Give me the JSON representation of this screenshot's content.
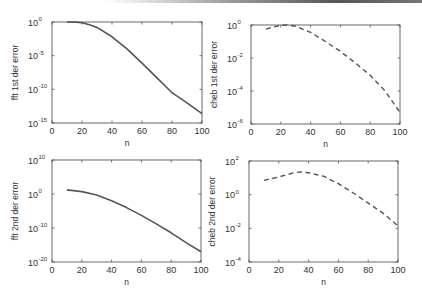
{
  "figure": {
    "layout": "2x2 subplots",
    "line_color": "#555555"
  },
  "chart_data": [
    {
      "id": "fft1",
      "type": "line",
      "title": "",
      "xlabel": "n",
      "ylabel": "fft 1st der error",
      "yscale": "log",
      "xlim": [
        0,
        100
      ],
      "ylim_exp": [
        -15,
        0
      ],
      "xticks": [
        0,
        20,
        40,
        60,
        80,
        100
      ],
      "yticks_exp": [
        0,
        -5,
        -10,
        -15
      ],
      "line_style": "solid",
      "box": {
        "left": 52,
        "top": 22,
        "right": 202,
        "bottom": 123
      },
      "series": [
        {
          "name": "fft 1st der error",
          "x": [
            10,
            15,
            20,
            25,
            30,
            40,
            50,
            60,
            70,
            80,
            90,
            100
          ],
          "y_exp": [
            0,
            0,
            -0.1,
            -0.4,
            -0.8,
            -2.2,
            -4.0,
            -6.1,
            -8.3,
            -10.5,
            -12.0,
            -13.6
          ]
        }
      ],
      "grid": false
    },
    {
      "id": "cheb1",
      "type": "line",
      "title": "",
      "xlabel": "n",
      "ylabel": "cheb 1st der error",
      "yscale": "log",
      "xlim": [
        0,
        100
      ],
      "ylim_exp": [
        -6,
        0
      ],
      "xticks": [
        0,
        20,
        40,
        60,
        80,
        100
      ],
      "yticks_exp": [
        0,
        -2,
        -4,
        -6
      ],
      "line_style": "dashed",
      "box": {
        "left": 251,
        "top": 25,
        "right": 400,
        "bottom": 124
      },
      "series": [
        {
          "name": "cheb 1st der error",
          "x": [
            10,
            15,
            20,
            25,
            30,
            40,
            50,
            60,
            70,
            80,
            90,
            100
          ],
          "y_exp": [
            -0.25,
            -0.12,
            -0.02,
            0,
            -0.08,
            -0.45,
            -1.0,
            -1.6,
            -2.3,
            -3.05,
            -4.0,
            -5.3
          ]
        }
      ],
      "grid": false
    },
    {
      "id": "fft2",
      "type": "line",
      "title": "",
      "xlabel": "n",
      "ylabel": "fft 2nd der error",
      "yscale": "log",
      "xlim": [
        0,
        100
      ],
      "ylim_exp": [
        -20,
        10
      ],
      "xticks": [
        0,
        20,
        40,
        60,
        80,
        100
      ],
      "yticks_exp": [
        10,
        0,
        -10,
        -20
      ],
      "line_style": "solid",
      "box": {
        "left": 52,
        "top": 160,
        "right": 201,
        "bottom": 262
      },
      "series": [
        {
          "name": "fft 2nd der error",
          "x": [
            10,
            20,
            30,
            40,
            50,
            60,
            70,
            80,
            90,
            100
          ],
          "y_exp": [
            1.2,
            0.7,
            -0.3,
            -2.0,
            -4.0,
            -6.3,
            -8.8,
            -11.4,
            -14.3,
            -17.0
          ]
        }
      ],
      "grid": false
    },
    {
      "id": "cheb2",
      "type": "line",
      "title": "",
      "xlabel": "n",
      "ylabel": "cheb 2nd der error",
      "yscale": "log",
      "xlim": [
        0,
        100
      ],
      "ylim_exp": [
        -4,
        2
      ],
      "xticks": [
        0,
        20,
        40,
        60,
        80,
        100
      ],
      "yticks_exp": [
        2,
        0,
        -2,
        -4
      ],
      "line_style": "dashed",
      "box": {
        "left": 249,
        "top": 161,
        "right": 398,
        "bottom": 262
      },
      "series": [
        {
          "name": "cheb 2nd der error",
          "x": [
            10,
            20,
            30,
            35,
            40,
            50,
            60,
            70,
            80,
            90,
            100
          ],
          "y_exp": [
            0.85,
            1.05,
            1.3,
            1.35,
            1.3,
            1.1,
            0.65,
            0.1,
            -0.5,
            -1.1,
            -1.85
          ]
        }
      ],
      "grid": false
    }
  ]
}
